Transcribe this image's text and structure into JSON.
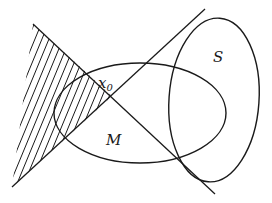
{
  "figure": {
    "type": "convex-separation-diagram",
    "labels": {
      "x0": "x",
      "x0_sub": "0",
      "M": "M",
      "S": "S"
    },
    "colors": {
      "stroke": "#1a1a1a",
      "background": "#ffffff",
      "hatch": "#1a1a1a"
    },
    "geometry": {
      "line1": {
        "from": [
          33,
          24
        ],
        "to": [
          215,
          194
        ]
      },
      "line2": {
        "from": [
          12,
          187
        ],
        "to": [
          205,
          9
        ]
      },
      "intersection": [
        112,
        96
      ],
      "set_M": {
        "cx": 140,
        "cy": 113,
        "rx": 86,
        "ry": 50
      },
      "set_S": {
        "cx": 214,
        "cy": 100,
        "rx": 45,
        "ry": 82,
        "rotate": 4
      },
      "hatched_region": [
        [
          33,
          24
        ],
        [
          112,
          96
        ],
        [
          12,
          187
        ]
      ]
    }
  }
}
